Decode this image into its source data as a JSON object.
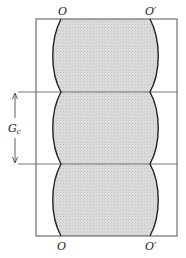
{
  "diagram": {
    "labels": {
      "top_left": "O",
      "top_right": "O′",
      "bottom_left": "O",
      "bottom_right": "O′",
      "period_main": "G",
      "period_sub": "c"
    },
    "colors": {
      "fill": "#d8d8d8",
      "stroke": "#222222",
      "frame": "#555555"
    },
    "frame": {
      "x": 36,
      "y": 19,
      "width": 141,
      "height": 217
    },
    "divider_lines_y": [
      92,
      164
    ],
    "period_count": 3
  }
}
